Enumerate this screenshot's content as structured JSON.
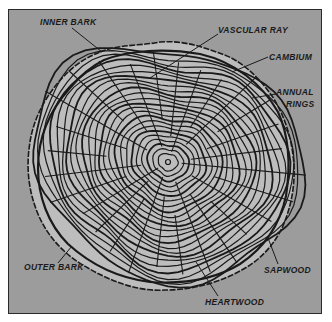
{
  "diagram": {
    "background_color": "#9c9c9c",
    "frame_color": "#2a2a2a",
    "line_color": "#1a1a1a",
    "bark_color": "#bdbdbd",
    "labels": {
      "inner_bark": "INNER BARK",
      "vascular_ray": "VASCULAR RAY",
      "cambium": "CAMBIUM",
      "annual_rings_1": "ANNUAL",
      "annual_rings_2": "RINGS",
      "outer_bark": "OUTER BARK",
      "sapwood": "SAPWOOD",
      "heartwood": "HEARTWOOD"
    }
  }
}
